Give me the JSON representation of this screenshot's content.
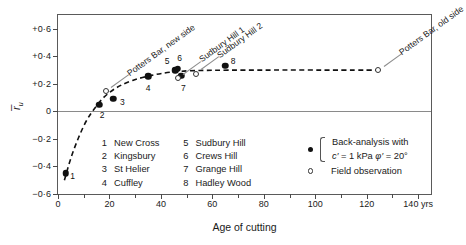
{
  "chart_data": {
    "type": "scatter",
    "title": "",
    "xlabel": "Age of cutting",
    "ylabel": "r̄u",
    "xlim": [
      0,
      145
    ],
    "ylim": [
      -0.6,
      0.7
    ],
    "xticks": [
      0,
      10,
      20,
      30,
      40,
      50,
      60,
      70,
      80,
      90,
      100,
      110,
      120,
      130,
      140
    ],
    "xtick_labels": [
      "0",
      "",
      "20",
      "",
      "40",
      "",
      "60",
      "",
      "80",
      "",
      "100",
      "",
      "120",
      "",
      "140 yrs"
    ],
    "yticks": [
      -0.6,
      -0.4,
      -0.2,
      0,
      0.2,
      0.4,
      0.6
    ],
    "ytick_labels": [
      "−0·6",
      "−0·4",
      "−0·2",
      "0",
      "+0·2",
      "+0·4",
      "+0·6"
    ],
    "grid": false,
    "zero_line": true,
    "series": [
      {
        "name": "Back-analysis with c' = 1 kPa φ' = 20°",
        "marker": "filled-circle",
        "points": [
          {
            "label": "1",
            "x": 3,
            "y": -0.45,
            "num_dx": 7,
            "num_dy": 3
          },
          {
            "label": "2",
            "x": 16,
            "y": 0.05,
            "num_dx": 3,
            "num_dy": 10
          },
          {
            "label": "3",
            "x": 21.5,
            "y": 0.09,
            "num_dx": 9,
            "num_dy": 3
          },
          {
            "label": "4",
            "x": 35,
            "y": 0.255,
            "num_dx": 0,
            "num_dy": 12
          },
          {
            "label": "5",
            "x": 45.5,
            "y": 0.3,
            "num_dx": -8,
            "num_dy": -9
          },
          {
            "label": "6",
            "x": 46.5,
            "y": 0.31,
            "num_dx": 2,
            "num_dy": -11
          },
          {
            "label": "7",
            "x": 48,
            "y": 0.26,
            "num_dx": 2,
            "num_dy": 12
          },
          {
            "label": "8",
            "x": 65,
            "y": 0.33,
            "num_dx": 8,
            "num_dy": -5
          }
        ]
      },
      {
        "name": "Field observation",
        "marker": "open-circle",
        "points": [
          {
            "label": "",
            "x": 18.5,
            "y": 0.145
          },
          {
            "label": "",
            "x": 46.5,
            "y": 0.245
          },
          {
            "label": "",
            "x": 53.5,
            "y": 0.275
          },
          {
            "label": "",
            "x": 124.5,
            "y": 0.3
          }
        ]
      }
    ],
    "trend_curve": {
      "style": "dashed",
      "points": [
        {
          "x": 2.5,
          "y": -0.5
        },
        {
          "x": 5,
          "y": -0.34
        },
        {
          "x": 8,
          "y": -0.19
        },
        {
          "x": 11,
          "y": -0.07
        },
        {
          "x": 14,
          "y": 0.015
        },
        {
          "x": 18,
          "y": 0.105
        },
        {
          "x": 23,
          "y": 0.175
        },
        {
          "x": 29,
          "y": 0.225
        },
        {
          "x": 36,
          "y": 0.26
        },
        {
          "x": 44,
          "y": 0.285
        },
        {
          "x": 55,
          "y": 0.297
        },
        {
          "x": 80,
          "y": 0.3
        },
        {
          "x": 110,
          "y": 0.3
        },
        {
          "x": 126,
          "y": 0.3
        }
      ]
    },
    "annotations": [
      {
        "text": "Potters Bar, new side",
        "target_x": 18.5,
        "target_y": 0.145,
        "angle": -36
      },
      {
        "text": "Sudbury Hill 1",
        "target_x": 46.5,
        "target_y": 0.245,
        "angle": -36
      },
      {
        "text": "Sudbury Hill 2",
        "target_x": 53.5,
        "target_y": 0.275,
        "angle": -36
      },
      {
        "text": "Potters Bar, old side",
        "target_x": 124.5,
        "target_y": 0.3,
        "angle": -36
      }
    ]
  },
  "site_legend": {
    "columns": [
      [
        {
          "index": "1",
          "name": "New Cross"
        },
        {
          "index": "2",
          "name": "Kingsbury"
        },
        {
          "index": "3",
          "name": "St Helier"
        },
        {
          "index": "4",
          "name": "Cuffley"
        }
      ],
      [
        {
          "index": "5",
          "name": "Sudbury Hill"
        },
        {
          "index": "6",
          "name": "Crews Hill"
        },
        {
          "index": "7",
          "name": "Grange Hill"
        },
        {
          "index": "8",
          "name": "Hadley Wood"
        }
      ]
    ]
  },
  "marker_key": {
    "back_analysis_line1": "Back-analysis with",
    "back_analysis_line2_c": "c′",
    "back_analysis_line2_rest": " = 1 kPa ",
    "back_analysis_line2_phi": "φ′",
    "back_analysis_line2_end": " = 20°",
    "field_observation": "Field observation"
  },
  "colors": {
    "frame": "#5a5a5a",
    "marker": "#111111",
    "curve": "#111111",
    "zero_line": "#8a8a8a",
    "leader": "#8d8d8d"
  }
}
